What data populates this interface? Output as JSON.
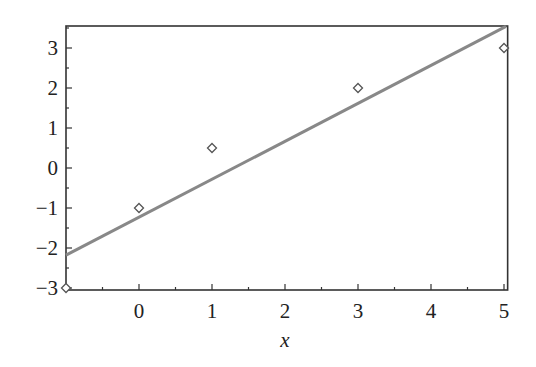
{
  "chart_data": {
    "type": "scatter",
    "title": "",
    "xlabel": "x",
    "ylabel": "",
    "xlim": [
      -1,
      5.05
    ],
    "ylim": [
      -3,
      3.55
    ],
    "grid": false,
    "legend": null,
    "x_ticks": [
      0,
      1,
      2,
      3,
      4,
      5
    ],
    "x_tick_labels": [
      "0",
      "1",
      "2",
      "3",
      "4",
      "5"
    ],
    "y_ticks": [
      -3,
      -2,
      -1,
      0,
      1,
      2,
      3
    ],
    "y_tick_labels": [
      "−3",
      "−2",
      "−1",
      "0",
      "1",
      "2",
      "3"
    ],
    "series": [
      {
        "name": "data points",
        "type": "scatter",
        "marker": "diamond",
        "x": [
          -1,
          0,
          1,
          3,
          5
        ],
        "y": [
          -3,
          -1,
          0.5,
          2,
          3
        ],
        "color": "#555555"
      },
      {
        "name": "least-squares fit",
        "type": "line",
        "x": [
          -1,
          5
        ],
        "y": [
          -2.18,
          3.54
        ],
        "slope": 0.953,
        "intercept": -1.224,
        "color": "#888888"
      }
    ]
  }
}
